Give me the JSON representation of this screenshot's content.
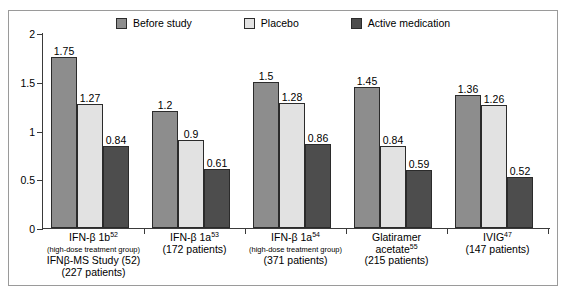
{
  "chart_data": {
    "type": "bar",
    "title": "",
    "subtitle": "",
    "xlabel": "",
    "ylabel": "",
    "ylim": [
      0,
      2
    ],
    "ytick_labels": [
      "0",
      "0.5",
      "1",
      "1.5",
      "2"
    ],
    "ytick_values": [
      0,
      0.5,
      1,
      1.5,
      2
    ],
    "grid": false,
    "legend_position": "top-center",
    "categories": [
      "IFN-β 1b52 (high-dose treatment group) IFNβ-MS Study (52) (227 patients)",
      "IFN-β 1a53 (172 patients)",
      "IFN-β 1a54 (high-dose treatment group) (371 patients)",
      "Glatiramer acetate55 (215 patients)",
      "IVIG47 (147 patients)"
    ],
    "series": [
      {
        "name": "Before study",
        "color": "#8d8d8d",
        "values": [
          1.75,
          1.2,
          1.5,
          1.45,
          1.36
        ],
        "value_labels": [
          "1.75",
          "1.2",
          "1.5",
          "1.45",
          "1.36"
        ]
      },
      {
        "name": "Placebo",
        "color": "#e2e2e2",
        "values": [
          1.27,
          0.9,
          1.28,
          0.84,
          1.26
        ],
        "value_labels": [
          "1.27",
          "0.9",
          "1.28",
          "0.84",
          "1.26"
        ]
      },
      {
        "name": "Active medication",
        "color": "#4d4d4d",
        "values": [
          0.84,
          0.61,
          0.86,
          0.59,
          0.52
        ],
        "value_labels": [
          "0.84",
          "0.61",
          "0.86",
          "0.59",
          "0.52"
        ]
      }
    ]
  },
  "legend": {
    "items": [
      {
        "label": "Before study",
        "color": "#8d8d8d"
      },
      {
        "label": "Placebo",
        "color": "#e2e2e2"
      },
      {
        "label": "Active medication",
        "color": "#4d4d4d"
      }
    ]
  },
  "x_axis_labels": [
    {
      "lines": [
        {
          "text": "IFN-β 1b",
          "sup": "52",
          "size": "main"
        },
        {
          "text": "(high-dose treatment group)",
          "sup": "",
          "size": "small"
        },
        {
          "text": "IFNβ-MS Study (52)",
          "sup": "",
          "size": "main"
        },
        {
          "text": "(227 patients)",
          "sup": "",
          "size": "main"
        }
      ]
    },
    {
      "lines": [
        {
          "text": "IFN-β 1a",
          "sup": "53",
          "size": "main"
        },
        {
          "text": "(172 patients)",
          "sup": "",
          "size": "main"
        }
      ]
    },
    {
      "lines": [
        {
          "text": "IFN-β 1a",
          "sup": "54",
          "size": "main"
        },
        {
          "text": "(high-dose treatment group)",
          "sup": "",
          "size": "small"
        },
        {
          "text": "(371 patients)",
          "sup": "",
          "size": "main"
        }
      ]
    },
    {
      "lines": [
        {
          "text": "Glatiramer",
          "sup": "",
          "size": "main"
        },
        {
          "text": "acetate",
          "sup": "55",
          "size": "main"
        },
        {
          "text": "(215 patients)",
          "sup": "",
          "size": "main"
        }
      ]
    },
    {
      "lines": [
        {
          "text": "IVIG",
          "sup": "47",
          "size": "main"
        },
        {
          "text": "(147 patients)",
          "sup": "",
          "size": "main"
        }
      ]
    }
  ],
  "colors": {
    "frame": "#9a9a9a",
    "axis": "#3a3a3a",
    "bar_outline": "#2b2b2b",
    "background": "#ffffff"
  }
}
